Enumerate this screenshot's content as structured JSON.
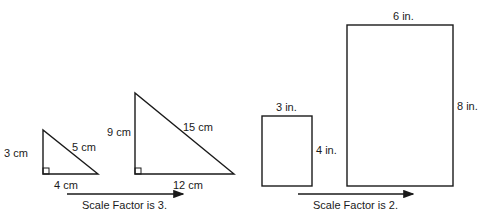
{
  "diagram": {
    "triangles": {
      "small": {
        "leg_vertical": "3 cm",
        "leg_horizontal": "4 cm",
        "hypotenuse": "5 cm"
      },
      "large": {
        "leg_vertical": "9 cm",
        "leg_horizontal": "12 cm",
        "hypotenuse": "15 cm"
      },
      "caption": "Scale Factor is 3."
    },
    "rectangles": {
      "small": {
        "width": "3 in.",
        "height": "4 in."
      },
      "large": {
        "width": "6 in.",
        "height": "8 in."
      },
      "caption": "Scale Factor is 2."
    },
    "colors": {
      "stroke": "#1a1a1a",
      "background": "#ffffff"
    }
  }
}
